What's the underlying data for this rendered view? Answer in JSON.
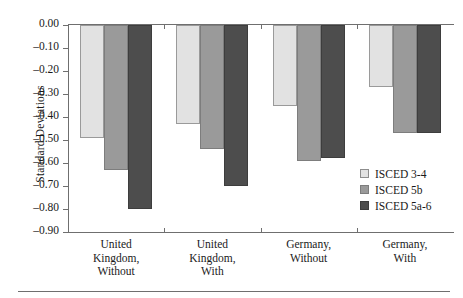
{
  "chart_data": {
    "type": "bar",
    "title": "",
    "xlabel": "",
    "ylabel": "Standard Deviations",
    "ylim": [
      -0.9,
      0.0
    ],
    "yticks": [
      "0.00",
      "–0.10",
      "–0.20",
      "–0.30",
      "–0.40",
      "–0.50",
      "–0.60",
      "–0.70",
      "–0.80",
      "–0.90"
    ],
    "ytick_values": [
      0.0,
      -0.1,
      -0.2,
      -0.3,
      -0.4,
      -0.5,
      -0.6,
      -0.7,
      -0.8,
      -0.9
    ],
    "grid": false,
    "legend_position": "lower-right",
    "categories": [
      "United\nKingdom,\nWithout",
      "United\nKingdom,\nWith",
      "Germany,\nWithout",
      "Germany,\nWith"
    ],
    "category_lines": [
      [
        "United",
        "Kingdom,",
        "Without"
      ],
      [
        "United",
        "Kingdom,",
        "With"
      ],
      [
        "Germany,",
        "Without"
      ],
      [
        "Germany,",
        "With"
      ]
    ],
    "series": [
      {
        "name": "ISCED 3-4",
        "color": "#e2e2e2",
        "values": [
          -0.49,
          -0.43,
          -0.35,
          -0.27
        ]
      },
      {
        "name": "ISCED 5b",
        "color": "#9a9a9a",
        "values": [
          -0.63,
          -0.54,
          -0.59,
          -0.47
        ]
      },
      {
        "name": "ISCED 5a-6",
        "color": "#4d4d4d",
        "values": [
          -0.8,
          -0.7,
          -0.58,
          -0.47
        ]
      }
    ]
  },
  "legend": {
    "items": [
      {
        "label": "ISCED 3-4"
      },
      {
        "label": "ISCED 5b"
      },
      {
        "label": "ISCED 5a-6"
      }
    ]
  }
}
